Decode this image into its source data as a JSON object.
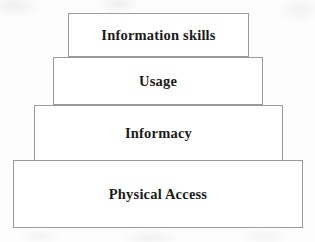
{
  "diagram": {
    "type": "stacked-pyramid",
    "orientation": "bottom-up",
    "level_count": 4,
    "background_color": "#fdfdfd",
    "box_fill_color": "#ffffff",
    "box_border_color": "#9a9a9a",
    "text_color": "#1b1b1b",
    "levels": [
      {
        "label": "Information skills",
        "rank": 4,
        "position": "top",
        "width_px": 181
      },
      {
        "label": "Usage",
        "rank": 3,
        "position": "upper-middle",
        "width_px": 210
      },
      {
        "label": "Informacy",
        "rank": 2,
        "position": "lower-middle",
        "width_px": 249
      },
      {
        "label": "Physical Access",
        "rank": 1,
        "position": "base",
        "width_px": 290
      }
    ]
  }
}
